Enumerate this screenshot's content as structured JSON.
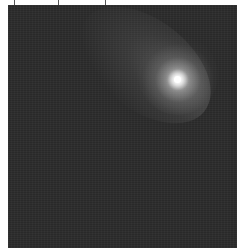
{
  "image": {
    "subject": "comet",
    "description": "Grayscale astronomical image of a comet with bright nucleus and faint tail against a dark noisy background",
    "colors": {
      "background": "#2b2b2b",
      "margin": "#ffffff",
      "nucleus": "#ffffff"
    },
    "nucleus_position": {
      "x": 178,
      "y": 80
    },
    "tail_direction": "down-left"
  },
  "ticks": [
    14,
    58,
    105
  ]
}
